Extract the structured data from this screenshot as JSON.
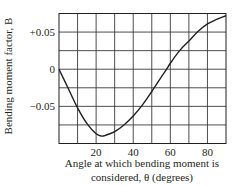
{
  "chart_data": {
    "type": "line",
    "title": "",
    "xlabel": "Angle at which bending moment is considered, θ (degrees)",
    "xlabel_lines": [
      "Angle at which bending moment is",
      "considered, θ (degrees)"
    ],
    "ylabel": "Bending moment factor, B",
    "xlim": [
      0,
      90
    ],
    "ylim": [
      -0.1,
      0.075
    ],
    "grid": true,
    "legend": null,
    "x_ticks": [
      20,
      40,
      60,
      80
    ],
    "x_tick_labels": [
      "20",
      "40",
      "60",
      "80"
    ],
    "x_gridlines": [
      10,
      20,
      30,
      40,
      50,
      60,
      70,
      80
    ],
    "y_ticks": [
      0.05,
      0,
      -0.05
    ],
    "y_tick_labels": [
      "+0.05",
      "0",
      "−0.05"
    ],
    "y_gridlines": [
      0.05,
      0.025,
      0,
      -0.025,
      -0.05,
      -0.075
    ],
    "series": [
      {
        "name": "B",
        "x": [
          0,
          5,
          10,
          15,
          20,
          23,
          25,
          30,
          35,
          40,
          45,
          50,
          55,
          58,
          60,
          65,
          70,
          75,
          80,
          85,
          90
        ],
        "values": [
          0,
          -0.026,
          -0.052,
          -0.073,
          -0.087,
          -0.09,
          -0.089,
          -0.084,
          -0.075,
          -0.063,
          -0.048,
          -0.03,
          -0.011,
          0.0,
          0.008,
          0.025,
          0.038,
          0.051,
          0.061,
          0.067,
          0.072
        ]
      }
    ]
  },
  "plot": {
    "left": 59,
    "right": 226,
    "top": 13.5,
    "bottom": 143.5
  }
}
